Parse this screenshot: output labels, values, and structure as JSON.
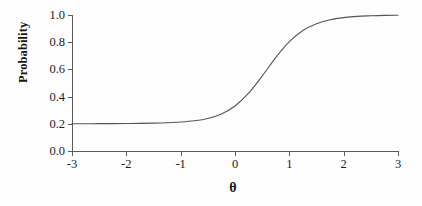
{
  "chart_data": {
    "type": "line",
    "title": "",
    "xlabel": "θ",
    "ylabel": "Probability",
    "xlim": [
      -3,
      3
    ],
    "ylim": [
      0.0,
      1.0
    ],
    "grid": false,
    "legend": "none",
    "x_ticks": [
      "-3",
      "-2",
      "-1",
      "0",
      "1",
      "2",
      "3"
    ],
    "x_tick_values": [
      -3,
      -2,
      -1,
      0,
      1,
      2,
      3
    ],
    "y_ticks": [
      "0.0",
      "0.2",
      "0.4",
      "0.6",
      "0.8",
      "1.0"
    ],
    "y_tick_values": [
      0.0,
      0.2,
      0.4,
      0.6,
      0.8,
      1.0
    ],
    "series": [
      {
        "name": "Item characteristic curve",
        "color": "#555555",
        "x": [
          -3.0,
          -2.75,
          -2.5,
          -2.25,
          -2.0,
          -1.75,
          -1.5,
          -1.25,
          -1.0,
          -0.75,
          -0.5,
          -0.25,
          0.0,
          0.25,
          0.5,
          0.75,
          1.0,
          1.25,
          1.5,
          1.75,
          2.0,
          2.25,
          2.5,
          2.75,
          3.0
        ],
        "values": [
          0.2,
          0.2,
          0.201,
          0.201,
          0.202,
          0.203,
          0.205,
          0.208,
          0.213,
          0.222,
          0.239,
          0.272,
          0.331,
          0.425,
          0.551,
          0.687,
          0.804,
          0.886,
          0.936,
          0.965,
          0.981,
          0.99,
          0.994,
          0.997,
          0.998
        ]
      }
    ],
    "annotations": {
      "lower_asymptote": 0.2,
      "upper_asymptote": 1.0
    }
  }
}
